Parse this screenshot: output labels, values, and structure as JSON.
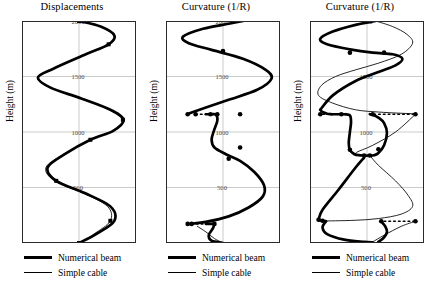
{
  "figure": {
    "width": 432,
    "height": 285,
    "background": "#ffffff",
    "ink_color": "#000000",
    "grid_color": "#b4b4b4"
  },
  "legend": {
    "numerical_beam_label": "Numerical beam",
    "simple_cable_label": "Simple cable"
  },
  "panels": [
    {
      "title": "Displacements",
      "ylabel": "Height (m)"
    },
    {
      "title": "Curvature (1/R)",
      "ylabel": "Height (m)"
    },
    {
      "title": "Curvature (1/R)",
      "ylabel": "Height (m)"
    }
  ],
  "chart_data": [
    {
      "type": "line",
      "title": "Displacements",
      "xlabel": "",
      "ylabel": "Height (m)",
      "ylim": [
        0,
        2000
      ],
      "xlim": [
        -1,
        1
      ],
      "yticks": [
        0,
        500,
        1000,
        1500,
        2000
      ],
      "ytick_labels": [
        "0",
        "500",
        "1000",
        "1500",
        "2000"
      ],
      "grid": true,
      "legend_position": "below-left",
      "series": [
        {
          "name": "Numerical beam",
          "style": "thick-solid",
          "x": [
            0.0,
            0.38,
            0.62,
            0.52,
            0.12,
            -0.45,
            -0.72,
            -0.5,
            0.05,
            0.55,
            0.78,
            0.6,
            0.2,
            -0.25,
            -0.55,
            -0.4,
            0.1,
            0.55,
            0.62,
            0.3,
            0.0
          ],
          "y": [
            2000,
            1950,
            1870,
            1790,
            1700,
            1570,
            1490,
            1400,
            1300,
            1200,
            1110,
            1010,
            930,
            800,
            680,
            560,
            450,
            330,
            200,
            80,
            0
          ]
        },
        {
          "name": "Simple cable",
          "style": "thin-solid",
          "x": [
            0.0,
            0.37,
            0.61,
            0.51,
            0.11,
            -0.46,
            -0.73,
            -0.51,
            0.04,
            0.54,
            0.77,
            0.59,
            0.19,
            -0.27,
            -0.58,
            -0.43,
            0.07,
            0.5,
            0.55,
            0.26,
            0.0
          ],
          "y": [
            2000,
            1950,
            1870,
            1790,
            1700,
            1570,
            1490,
            1400,
            1300,
            1200,
            1110,
            1010,
            930,
            800,
            680,
            560,
            450,
            330,
            200,
            80,
            0
          ]
        }
      ],
      "markers": {
        "shape": "square",
        "points": [
          {
            "x": 0.0,
            "y": 2000
          },
          {
            "x": 0.52,
            "y": 1790
          },
          {
            "x": 0.77,
            "y": 1110
          },
          {
            "x": 0.2,
            "y": 930
          },
          {
            "x": -0.4,
            "y": 560
          },
          {
            "x": 0.55,
            "y": 200
          },
          {
            "x": 0.0,
            "y": 0
          }
        ]
      }
    },
    {
      "type": "line",
      "title": "Curvature (1/R)",
      "xlabel": "",
      "ylabel": "Height (m)",
      "ylim": [
        0,
        2000
      ],
      "xlim": [
        -1,
        1
      ],
      "yticks": [
        0,
        500,
        1000,
        1500,
        2000
      ],
      "ytick_labels": [
        "0",
        "500",
        "1000",
        "1500",
        "2000"
      ],
      "grid": true,
      "legend_position": "below-left",
      "series": [
        {
          "name": "Numerical beam",
          "style": "thick-solid",
          "segments": [
            {
              "x": [
                0.35,
                0.1,
                -0.35,
                -0.7,
                -0.6,
                -0.2,
                0.35,
                0.75,
                0.85,
                0.6,
                0.1,
                -0.3,
                -0.55,
                -0.62
              ],
              "y": [
                2000,
                1975,
                1930,
                1860,
                1800,
                1740,
                1660,
                1560,
                1480,
                1380,
                1290,
                1220,
                1175,
                1160
              ]
            },
            {
              "x": [
                -0.3,
                -0.22,
                -0.2
              ],
              "y": [
                1160,
                1160,
                1160
              ]
            },
            {
              "x": [
                -0.2,
                -0.12,
                -0.1,
                -0.16,
                -0.2,
                -0.15,
                0.05,
                0.3,
                0.55,
                0.72,
                0.7,
                0.45,
                0.1,
                -0.3,
                -0.55,
                -0.62
              ],
              "y": [
                1160,
                1155,
                1100,
                1010,
                930,
                860,
                800,
                740,
                640,
                520,
                420,
                320,
                240,
                190,
                175,
                172
              ]
            },
            {
              "x": [
                -0.3,
                -0.2,
                -0.15
              ],
              "y": [
                172,
                172,
                172
              ]
            },
            {
              "x": [
                -0.15,
                -0.18,
                -0.25,
                -0.2,
                0.0
              ],
              "y": [
                172,
                130,
                70,
                20,
                0
              ]
            }
          ]
        },
        {
          "name": "Simple cable",
          "style": "thin-solid",
          "segments": [
            {
              "x": [
                -0.45,
                -0.3,
                -0.15,
                0.0
              ],
              "y": [
                150,
                100,
                40,
                0
              ]
            }
          ]
        }
      ],
      "markers": {
        "shape": "circle-and-square",
        "points": [
          {
            "x": -0.62,
            "y": 1160
          },
          {
            "x": -0.48,
            "y": 1160
          },
          {
            "x": -0.22,
            "y": 1160
          },
          {
            "x": -0.1,
            "y": 1160
          },
          {
            "x": 0.3,
            "y": 1160
          },
          {
            "x": 0.0,
            "y": 1730
          },
          {
            "x": 0.3,
            "y": 860
          },
          {
            "x": 0.1,
            "y": 760
          },
          {
            "x": -0.62,
            "y": 172
          },
          {
            "x": -0.55,
            "y": 172
          },
          {
            "x": -0.15,
            "y": 172
          }
        ]
      },
      "dashed_connectors": [
        {
          "x": [
            -0.48,
            -0.22
          ],
          "y": [
            1160,
            1160
          ]
        },
        {
          "x": [
            -0.55,
            -0.15
          ],
          "y": [
            172,
            172
          ]
        }
      ]
    },
    {
      "type": "line",
      "title": "Curvature (1/R)",
      "xlabel": "",
      "ylabel": "Height (m)",
      "ylim": [
        0,
        2000
      ],
      "xlim": [
        -1,
        1
      ],
      "yticks": [
        0,
        500,
        1000,
        1500,
        2000
      ],
      "ytick_labels": [
        "0",
        "500",
        "1000",
        "1500",
        "2000"
      ],
      "grid": true,
      "legend_position": "below-left",
      "series": [
        {
          "name": "Numerical beam",
          "style": "thick-solid",
          "segments": [
            {
              "x": [
                0.15,
                -0.2,
                -0.6,
                -0.82,
                -0.7,
                -0.3,
                0.1,
                0.45,
                0.62,
                0.5,
                0.2,
                -0.2,
                -0.6,
                -0.82
              ],
              "y": [
                2000,
                1965,
                1905,
                1840,
                1790,
                1745,
                1715,
                1700,
                1660,
                1600,
                1540,
                1460,
                1330,
                1200
              ]
            },
            {
              "x": [
                -0.82,
                -0.78,
                -0.7,
                -0.62
              ],
              "y": [
                1200,
                1180,
                1165,
                1160
              ]
            },
            {
              "x": [
                -0.62,
                -0.45,
                -0.38
              ],
              "y": [
                1160,
                1160,
                1160
              ]
            },
            {
              "x": [
                -0.38,
                -0.3,
                -0.28,
                -0.3,
                -0.32,
                -0.3,
                -0.22,
                -0.12,
                -0.05
              ],
              "y": [
                1160,
                1150,
                1090,
                1000,
                900,
                840,
                800,
                790,
                788
              ]
            },
            {
              "x": [
                0.05,
                0.12,
                0.2,
                0.3,
                0.35,
                0.3,
                0.2,
                0.1,
                0.05
              ],
              "y": [
                788,
                790,
                810,
                880,
                990,
                1080,
                1130,
                1155,
                1160
              ]
            },
            {
              "x": [
                -0.05,
                0.05
              ],
              "y": [
                788,
                788
              ]
            },
            {
              "x": [
                -0.05,
                -0.2,
                -0.5,
                -0.78,
                -0.85
              ],
              "y": [
                770,
                680,
                480,
                300,
                210
              ]
            },
            {
              "x": [
                -0.85,
                -0.78,
                -0.72
              ],
              "y": [
                210,
                200,
                196
              ]
            },
            {
              "x": [
                -0.72,
                -0.78,
                -0.7,
                -0.4,
                -0.05,
                0.1
              ],
              "y": [
                196,
                140,
                80,
                30,
                10,
                5
              ]
            },
            {
              "x": [
                0.25,
                0.32,
                0.35,
                0.3,
                0.2
              ],
              "y": [
                195,
                150,
                100,
                50,
                10
              ]
            }
          ]
        },
        {
          "name": "Simple cable",
          "style": "thin-solid",
          "segments": [
            {
              "x": [
                0.15,
                0.45,
                0.7,
                0.8,
                0.6,
                0.2,
                -0.2,
                -0.55,
                -0.8,
                -0.85,
                -0.6,
                -0.2,
                0.2,
                0.55,
                0.78,
                0.85
              ],
              "y": [
                2000,
                1950,
                1880,
                1800,
                1700,
                1620,
                1560,
                1500,
                1420,
                1330,
                1260,
                1200,
                1180,
                1170,
                1165,
                1160
              ]
            },
            {
              "x": [
                0.85,
                0.5,
                0.1,
                -0.2,
                -0.05
              ],
              "y": [
                1160,
                1000,
                880,
                810,
                788
              ]
            },
            {
              "x": [
                0.05,
                0.2,
                0.5,
                0.72,
                0.8,
                0.6,
                0.2,
                -0.2,
                -0.55,
                -0.8,
                -0.85
              ],
              "y": [
                788,
                700,
                560,
                430,
                330,
                260,
                220,
                205,
                200,
                198,
                196
              ]
            },
            {
              "x": [
                0.85,
                0.6,
                0.3,
                0.1
              ],
              "y": [
                196,
                150,
                70,
                10
              ]
            }
          ]
        }
      ],
      "markers": {
        "shape": "circle-and-square",
        "points": [
          {
            "x": -0.3,
            "y": 1715
          },
          {
            "x": 0.3,
            "y": 1715
          },
          {
            "x": -0.82,
            "y": 1160
          },
          {
            "x": -0.45,
            "y": 1160
          },
          {
            "x": 0.1,
            "y": 1160
          },
          {
            "x": 0.85,
            "y": 1160
          },
          {
            "x": -0.3,
            "y": 840
          },
          {
            "x": 0.2,
            "y": 845
          },
          {
            "x": -0.05,
            "y": 788
          },
          {
            "x": 0.05,
            "y": 788
          },
          {
            "x": -0.85,
            "y": 210
          },
          {
            "x": -0.78,
            "y": 200
          },
          {
            "x": 0.25,
            "y": 196
          },
          {
            "x": 0.85,
            "y": 196
          }
        ]
      },
      "dashed_connectors": [
        {
          "x": [
            -0.78,
            -0.5
          ],
          "y": [
            1160,
            1160
          ]
        },
        {
          "x": [
            0.12,
            0.82
          ],
          "y": [
            1160,
            1160
          ]
        },
        {
          "x": [
            0.3,
            0.82
          ],
          "y": [
            196,
            196
          ]
        }
      ]
    }
  ]
}
